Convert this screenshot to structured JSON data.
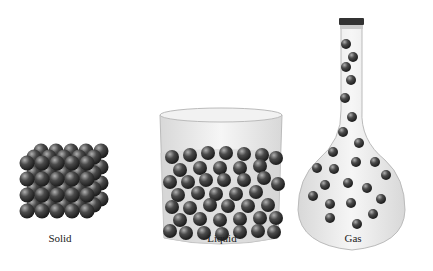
{
  "panels": [
    {
      "name": "solid",
      "label": "Solid"
    },
    {
      "name": "liquid",
      "label": "Liquid"
    },
    {
      "name": "gas",
      "label": "Gas"
    }
  ],
  "colors": {
    "particle": "#3a3a3a",
    "glass": "#e6e6e6"
  }
}
